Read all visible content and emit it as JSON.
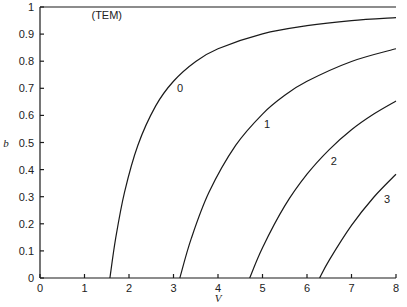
{
  "chart_data": {
    "type": "line",
    "title": "",
    "xlabel": "V",
    "ylabel": "b",
    "xlim": [
      0,
      8
    ],
    "ylim": [
      0,
      1
    ],
    "grid": false,
    "legend": "inline labels",
    "x_ticks": [
      "0",
      "1",
      "2",
      "3",
      "4",
      "5",
      "6",
      "7",
      "8"
    ],
    "y_ticks": [
      "0",
      "0.1",
      "0.2",
      "0.3",
      "0.4",
      "0.5",
      "0.6",
      "0.7",
      "0.8",
      "0.9",
      "1"
    ],
    "annotations": [
      {
        "text": "(TEM)",
        "x": 1.5,
        "y": 0.97
      },
      {
        "text": "0",
        "x": 3.15,
        "y": 0.7
      },
      {
        "text": "1",
        "x": 5.1,
        "y": 0.57
      },
      {
        "text": "2",
        "x": 6.6,
        "y": 0.43
      },
      {
        "text": "3",
        "x": 7.8,
        "y": 0.29
      }
    ],
    "series": [
      {
        "name": "TEM",
        "x": [
          0,
          8
        ],
        "y": [
          1.0,
          1.0
        ]
      },
      {
        "name": "0",
        "x": [
          1.571,
          1.7,
          1.9,
          2.2,
          2.6,
          3.0,
          3.5,
          4.0,
          5.0,
          6.0,
          7.0,
          8.0
        ],
        "y": [
          0,
          0.146,
          0.317,
          0.49,
          0.635,
          0.726,
          0.799,
          0.846,
          0.901,
          0.931,
          0.95,
          0.961
        ]
      },
      {
        "name": "1",
        "x": [
          3.142,
          3.4,
          3.8,
          4.4,
          5.0,
          5.5,
          6.0,
          7.0,
          8.0
        ],
        "y": [
          0,
          0.146,
          0.317,
          0.49,
          0.605,
          0.674,
          0.726,
          0.799,
          0.846
        ]
      },
      {
        "name": "2",
        "x": [
          4.712,
          5.0,
          5.5,
          6.0,
          6.5,
          7.0,
          7.5,
          8.0
        ],
        "y": [
          0,
          0.112,
          0.266,
          0.383,
          0.474,
          0.547,
          0.605,
          0.653
        ]
      },
      {
        "name": "3",
        "x": [
          6.283,
          6.5,
          7.0,
          7.5,
          8.0
        ],
        "y": [
          0,
          0.066,
          0.194,
          0.298,
          0.383
        ]
      }
    ]
  }
}
